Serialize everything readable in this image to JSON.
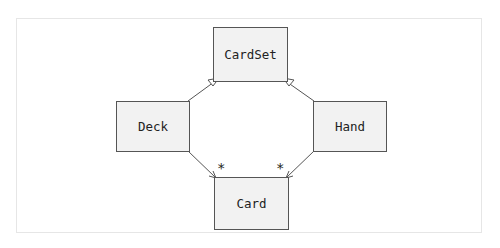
{
  "diagram": {
    "type": "UML class diagram",
    "classes": [
      {
        "id": "cardset",
        "name": "CardSet"
      },
      {
        "id": "deck",
        "name": "Deck"
      },
      {
        "id": "hand",
        "name": "Hand"
      },
      {
        "id": "card",
        "name": "Card"
      }
    ],
    "relations": [
      {
        "from": "Deck",
        "to": "CardSet",
        "kind": "generalization"
      },
      {
        "from": "Hand",
        "to": "CardSet",
        "kind": "generalization"
      },
      {
        "from": "Deck",
        "to": "Card",
        "kind": "association",
        "multiplicity": "*"
      },
      {
        "from": "Hand",
        "to": "Card",
        "kind": "association",
        "multiplicity": "*"
      }
    ],
    "multiplicity_deck_card": "*",
    "multiplicity_hand_card": "*"
  }
}
